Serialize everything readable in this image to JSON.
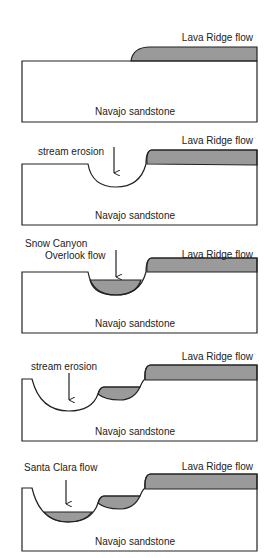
{
  "figure": {
    "type": "geologic cross-section sequence",
    "colors": {
      "lava_fill": "#9a9a9a",
      "line": "#222222",
      "background": "#ffffff"
    },
    "panels": [
      {
        "step": 1,
        "labels": {
          "lava": "Lava Ridge flow",
          "rock": "Navajo sandstone"
        }
      },
      {
        "step": 2,
        "labels": {
          "lava": "Lava Ridge flow",
          "process": "stream erosion",
          "rock": "Navajo sandstone"
        }
      },
      {
        "step": 3,
        "labels": {
          "lava": "Lava Ridge flow",
          "flow_line1": "Snow Canyon",
          "flow_line2": "Overlook flow",
          "rock": "Navajo sandstone"
        }
      },
      {
        "step": 4,
        "labels": {
          "lava": "Lava Ridge flow",
          "process": "stream erosion",
          "rock": "Navajo sandstone"
        }
      },
      {
        "step": 5,
        "labels": {
          "lava": "Lava Ridge flow",
          "flow": "Santa Clara flow",
          "rock": "Navajo sandstone"
        }
      }
    ]
  }
}
